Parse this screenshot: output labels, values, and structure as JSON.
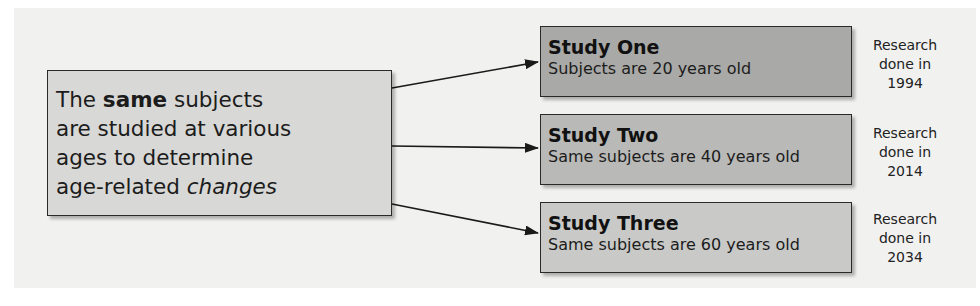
{
  "diagram": {
    "type": "longitudinal-study-flow",
    "source_box": {
      "line1_pre": "The ",
      "line1_bold": "same",
      "line1_post": " subjects",
      "line2": "are studied at various",
      "line3": "ages to determine",
      "line4_pre": "age-related ",
      "line4_italic": "changes"
    },
    "studies": [
      {
        "title": "Study One",
        "description": "Subjects are 20 years old",
        "note_line1": "Research",
        "note_line2": "done in",
        "note_year": "1994",
        "fill": "#a9a9a7"
      },
      {
        "title": "Study Two",
        "description": "Same subjects are 40 years old",
        "note_line1": "Research",
        "note_line2": "done in",
        "note_year": "2014",
        "fill": "#b9b9b7"
      },
      {
        "title": "Study Three",
        "description": "Same subjects are 60 years old",
        "note_line1": "Research",
        "note_line2": "done in",
        "note_year": "2034",
        "fill": "#c9c9c7"
      }
    ],
    "colors": {
      "background_panel": "#f1f1f0",
      "source_fill": "#d8d8d6",
      "border": "#2a2a2a",
      "arrow": "#1a1a1a"
    }
  }
}
